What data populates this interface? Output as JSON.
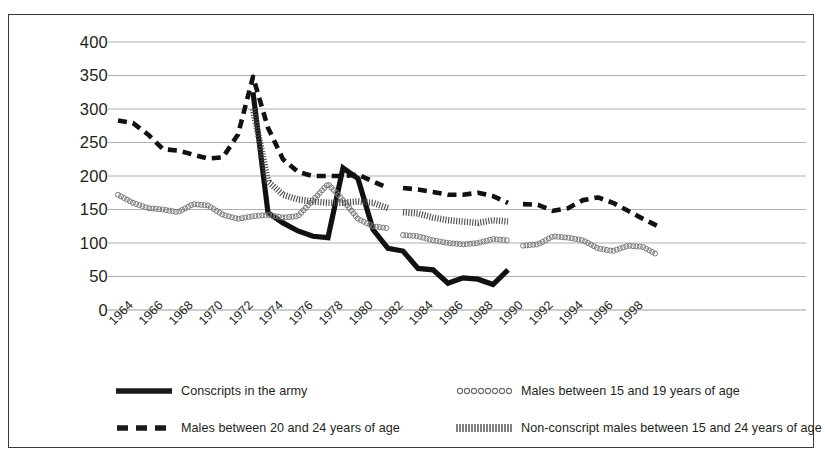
{
  "chart_data": {
    "type": "line",
    "title": "",
    "xlabel": "",
    "ylabel": "",
    "ylim": [
      0,
      400
    ],
    "ytick_step": 50,
    "yticks": [
      "400",
      "350",
      "300",
      "250",
      "200",
      "150",
      "100",
      "50",
      "0"
    ],
    "xlim": [
      1964,
      2000
    ],
    "xticks": [
      "1964",
      "1966",
      "1968",
      "1970",
      "1972",
      "1974",
      "1976",
      "1978",
      "1980",
      "1982",
      "1984",
      "1986",
      "1988",
      "1990",
      "1992",
      "1994",
      "1996",
      "1998"
    ],
    "xtick_step": 2,
    "grid": "horizontal",
    "legend_position": "bottom",
    "series": [
      {
        "name": "Conscripts in the army",
        "style": "solid-thick",
        "x": [
          1973,
          1974,
          1975,
          1976,
          1977,
          1978,
          1979,
          1980,
          1981,
          1982,
          1983,
          1984,
          1985,
          1986,
          1987,
          1988,
          1989,
          1990
        ],
        "values": [
          325,
          145,
          130,
          118,
          110,
          108,
          212,
          196,
          120,
          92,
          88,
          62,
          60,
          40,
          48,
          46,
          38,
          60
        ]
      },
      {
        "name": "Males between 20 and 24 years of age",
        "style": "dashed",
        "segments": [
          {
            "x": [
              1964,
              1965,
              1966,
              1967,
              1968,
              1969,
              1970,
              1971,
              1972,
              1973,
              1974,
              1975,
              1976,
              1977,
              1978,
              1979,
              1980,
              1981,
              1982
            ],
            "values": [
              283,
              279,
              262,
              240,
              238,
              232,
              226,
              228,
              262,
              348,
              272,
              225,
              206,
              200,
              200,
              200,
              202,
              192,
              182
            ]
          },
          {
            "x": [
              1983,
              1984,
              1985,
              1986,
              1987,
              1988,
              1989,
              1990
            ],
            "values": [
              182,
              180,
              176,
              172,
              172,
              175,
              170,
              160
            ]
          },
          {
            "x": [
              1991,
              1992,
              1993,
              1994,
              1995,
              1996,
              1997,
              1998,
              1999,
              2000
            ],
            "values": [
              158,
              157,
              148,
              152,
              164,
              168,
              160,
              148,
              136,
              125
            ]
          }
        ]
      },
      {
        "name": "Males between 15 and 19 years of age",
        "style": "circles",
        "segments": [
          {
            "x": [
              1964,
              1965,
              1966,
              1967,
              1968,
              1969,
              1970,
              1971,
              1972,
              1973,
              1974,
              1975,
              1976,
              1977,
              1978,
              1979,
              1980,
              1981,
              1982
            ],
            "values": [
              172,
              160,
              152,
              150,
              146,
              158,
              156,
              142,
              136,
              140,
              142,
              138,
              140,
              164,
              188,
              164,
              136,
              125,
              122
            ]
          },
          {
            "x": [
              1983,
              1984,
              1985,
              1986,
              1987,
              1988,
              1989,
              1990
            ],
            "values": [
              112,
              110,
              104,
              100,
              98,
              100,
              106,
              104
            ]
          },
          {
            "x": [
              1991,
              1992,
              1993,
              1994,
              1995,
              1996,
              1997,
              1998,
              1999,
              2000
            ],
            "values": [
              96,
              98,
              110,
              108,
              104,
              92,
              88,
              96,
              94,
              82
            ]
          }
        ]
      },
      {
        "name": "Non-conscript males between 15 and 24 years of age",
        "style": "hatched",
        "segments": [
          {
            "x": [
              1973,
              1974,
              1975,
              1976,
              1977,
              1978,
              1979,
              1980,
              1981,
              1982
            ],
            "values": [
              300,
              192,
              172,
              165,
              162,
              160,
              160,
              162,
              160,
              152
            ]
          },
          {
            "x": [
              1983,
              1984,
              1985,
              1986,
              1987,
              1988,
              1989,
              1990
            ],
            "values": [
              146,
              144,
              138,
              134,
              132,
              130,
              134,
              132
            ]
          }
        ]
      }
    ]
  },
  "legend": {
    "items": [
      {
        "label": "Conscripts in the army",
        "style": "solid-thick"
      },
      {
        "label": "Males between 15 and 19 years of age",
        "style": "circles"
      },
      {
        "label": "Males between 20 and 24 years of age",
        "style": "dashed"
      },
      {
        "label": "Non-conscript males between 15 and 24 years of age",
        "style": "hatched"
      }
    ]
  }
}
